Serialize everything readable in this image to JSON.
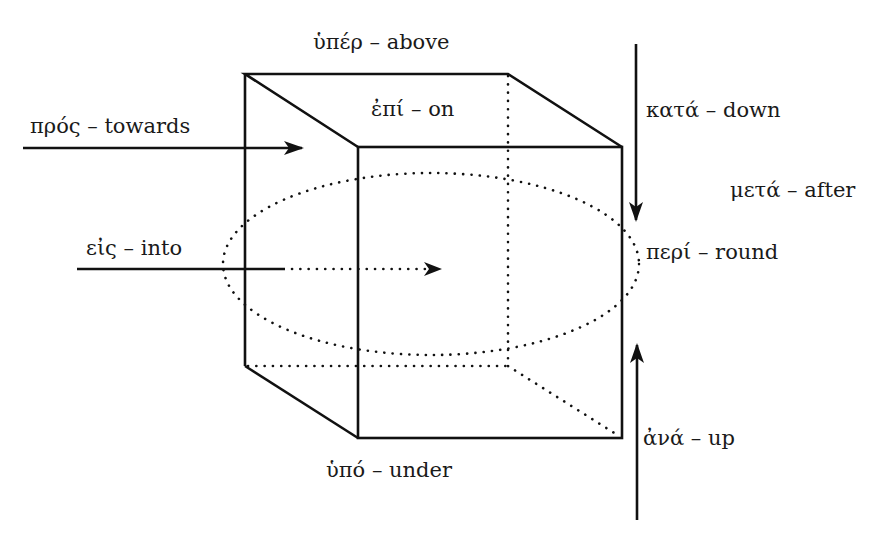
{
  "diagram": {
    "labels": {
      "hyper": "ὑπέρ – above",
      "epi": "ἐπί – on",
      "pros": "πρός – towards",
      "kata": "κατά – down",
      "meta": "μετά – after",
      "eis": "εἰς – into",
      "peri": "περί – round",
      "ana": "ἀνά – up",
      "hypo": "ὑπό – under"
    },
    "prepositions": [
      {
        "greek": "ὑπέρ",
        "english": "above"
      },
      {
        "greek": "ἐπί",
        "english": "on"
      },
      {
        "greek": "πρός",
        "english": "towards"
      },
      {
        "greek": "κατά",
        "english": "down"
      },
      {
        "greek": "μετά",
        "english": "after"
      },
      {
        "greek": "εἰς",
        "english": "into"
      },
      {
        "greek": "περί",
        "english": "round"
      },
      {
        "greek": "ἀνά",
        "english": "up"
      },
      {
        "greek": "ὑπό",
        "english": "under"
      }
    ],
    "colors": {
      "line": "#111111",
      "text": "#1a1a1a",
      "background": "#ffffff"
    }
  }
}
